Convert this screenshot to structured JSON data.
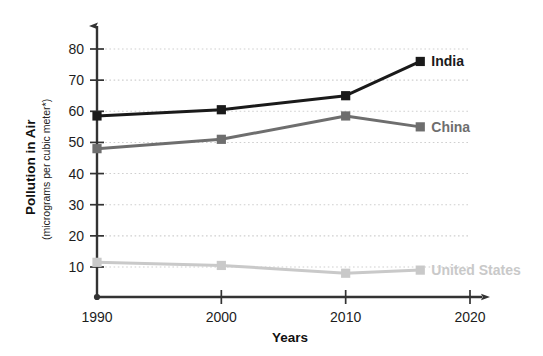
{
  "chart_data": {
    "type": "line",
    "title": "",
    "xlabel": "Years",
    "ylabel": "Pollution in Air",
    "ylabel_sub": "(micrograms per cubic meter*)",
    "x": [
      1990,
      2000,
      2010,
      2016
    ],
    "xlim": [
      1990,
      2020
    ],
    "ylim": [
      0,
      85
    ],
    "xticks": [
      "1990",
      "2000",
      "2010",
      "2020"
    ],
    "xtick_values": [
      1990,
      2000,
      2010,
      2020
    ],
    "yticks": [
      "10",
      "20",
      "30",
      "40",
      "50",
      "60",
      "70",
      "80"
    ],
    "ytick_values": [
      10,
      20,
      30,
      40,
      50,
      60,
      70,
      80
    ],
    "grid": "horizontal-dotted",
    "legend_position": "inline-right-end-of-line",
    "marker": "square",
    "series": [
      {
        "name": "India",
        "label": "India",
        "color": "#1a1a1a",
        "values": [
          58.5,
          60.5,
          65,
          76
        ]
      },
      {
        "name": "China",
        "label": "China",
        "color": "#6e6e6e",
        "values": [
          48,
          51,
          58.5,
          55
        ]
      },
      {
        "name": "United States",
        "label": "United States",
        "color": "#c9c9c9",
        "values": [
          11.5,
          10.5,
          8,
          9
        ]
      }
    ]
  },
  "axes": {
    "x_axis_name": "x-axis",
    "y_axis_name": "y-axis",
    "x_arrow": "arrowhead-right",
    "y_arrow": "arrowhead-up"
  },
  "colors": {
    "axis": "#333333",
    "grid": "#cfcfcf",
    "text": "#1d1d1d",
    "background": "#ffffff"
  }
}
